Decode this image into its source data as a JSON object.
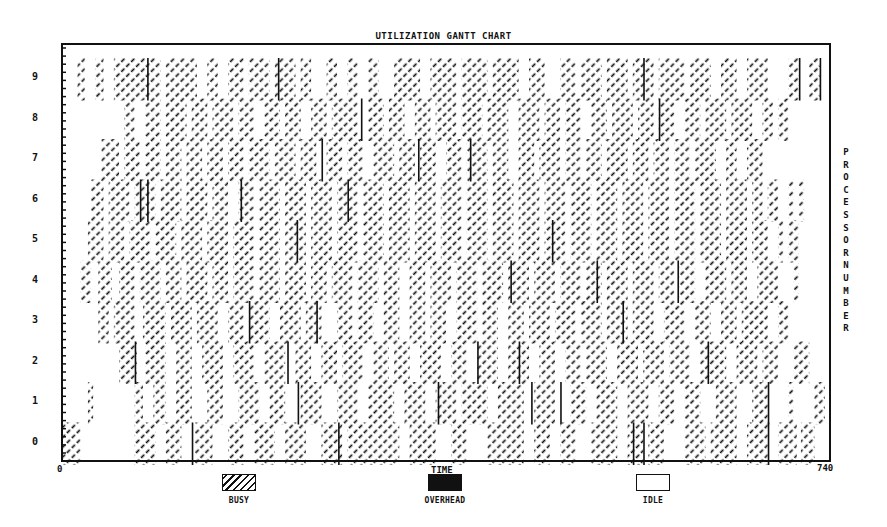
{
  "chart_data": {
    "type": "gantt",
    "title": "UTILIZATION GANTT CHART",
    "xlabel": "TIME",
    "ylabel": "PROCESSOR NUMBER",
    "xlim": [
      0,
      740
    ],
    "ylim": [
      0,
      9
    ],
    "x_tick_labels": [
      "0",
      "740"
    ],
    "y_tick_labels": [
      "0",
      "1",
      "2",
      "3",
      "4",
      "5",
      "6",
      "7",
      "8",
      "9"
    ],
    "grid": false,
    "legend": [
      {
        "key": "busy",
        "label": "BUSY",
        "style": "diagonal-hatch"
      },
      {
        "key": "overhead",
        "label": "OVERHEAD",
        "style": "solid-black"
      },
      {
        "key": "idle",
        "label": "IDLE",
        "style": "white"
      }
    ],
    "legend_position": "bottom",
    "processors": [
      {
        "id": 0,
        "busy": [
          [
            0,
            18
          ],
          [
            70,
            90
          ],
          [
            100,
            115
          ],
          [
            128,
            145
          ],
          [
            160,
            175
          ],
          [
            185,
            205
          ],
          [
            215,
            235
          ],
          [
            250,
            270
          ],
          [
            275,
            325
          ],
          [
            335,
            360
          ],
          [
            375,
            390
          ],
          [
            410,
            445
          ],
          [
            455,
            470
          ],
          [
            480,
            495
          ],
          [
            510,
            535
          ],
          [
            545,
            560
          ],
          [
            565,
            580
          ],
          [
            600,
            620
          ],
          [
            625,
            650
          ],
          [
            660,
            680
          ],
          [
            690,
            700
          ],
          [
            700,
            708
          ],
          [
            712,
            725
          ]
        ],
        "overhead": [
          [
            125,
            126
          ],
          [
            266,
            267
          ],
          [
            550,
            551
          ],
          [
            560,
            561
          ],
          [
            680,
            681
          ]
        ]
      },
      {
        "id": 1,
        "busy": [
          [
            25,
            30
          ],
          [
            70,
            78
          ],
          [
            88,
            100
          ],
          [
            110,
            125
          ],
          [
            140,
            155
          ],
          [
            170,
            190
          ],
          [
            200,
            215
          ],
          [
            230,
            250
          ],
          [
            265,
            285
          ],
          [
            295,
            320
          ],
          [
            330,
            350
          ],
          [
            360,
            380
          ],
          [
            385,
            410
          ],
          [
            420,
            445
          ],
          [
            455,
            475
          ],
          [
            490,
            505
          ],
          [
            515,
            535
          ],
          [
            545,
            565
          ],
          [
            575,
            590
          ],
          [
            600,
            615
          ],
          [
            630,
            650
          ],
          [
            665,
            680
          ],
          [
            700,
            705
          ],
          [
            725,
            735
          ]
        ],
        "overhead": [
          [
            227,
            228
          ],
          [
            362,
            363
          ],
          [
            452,
            453
          ],
          [
            480,
            481
          ],
          [
            680,
            681
          ]
        ]
      },
      {
        "id": 2,
        "busy": [
          [
            55,
            72
          ],
          [
            80,
            100
          ],
          [
            110,
            125
          ],
          [
            135,
            155
          ],
          [
            165,
            185
          ],
          [
            195,
            215
          ],
          [
            225,
            240
          ],
          [
            250,
            265
          ],
          [
            270,
            290
          ],
          [
            300,
            315
          ],
          [
            320,
            335
          ],
          [
            345,
            365
          ],
          [
            375,
            390
          ],
          [
            400,
            420
          ],
          [
            430,
            450
          ],
          [
            460,
            475
          ],
          [
            485,
            500
          ],
          [
            505,
            525
          ],
          [
            535,
            555
          ],
          [
            560,
            580
          ],
          [
            585,
            605
          ],
          [
            615,
            640
          ],
          [
            650,
            670
          ],
          [
            675,
            690
          ],
          [
            705,
            720
          ]
        ],
        "overhead": [
          [
            70,
            71
          ],
          [
            217,
            218
          ],
          [
            400,
            401
          ],
          [
            440,
            441
          ],
          [
            622,
            623
          ]
        ]
      },
      {
        "id": 3,
        "busy": [
          [
            35,
            45
          ],
          [
            50,
            70
          ],
          [
            78,
            100
          ],
          [
            105,
            125
          ],
          [
            130,
            150
          ],
          [
            160,
            175
          ],
          [
            180,
            200
          ],
          [
            210,
            230
          ],
          [
            235,
            250
          ],
          [
            265,
            280
          ],
          [
            285,
            300
          ],
          [
            310,
            325
          ],
          [
            335,
            350
          ],
          [
            355,
            370
          ],
          [
            380,
            400
          ],
          [
            405,
            420
          ],
          [
            430,
            445
          ],
          [
            450,
            470
          ],
          [
            475,
            495
          ],
          [
            500,
            520
          ],
          [
            525,
            545
          ],
          [
            550,
            570
          ],
          [
            580,
            600
          ],
          [
            610,
            625
          ],
          [
            635,
            650
          ],
          [
            655,
            680
          ],
          [
            690,
            700
          ]
        ],
        "overhead": [
          [
            180,
            181
          ],
          [
            245,
            246
          ],
          [
            540,
            541
          ]
        ]
      },
      {
        "id": 4,
        "busy": [
          [
            18,
            28
          ],
          [
            35,
            48
          ],
          [
            55,
            70
          ],
          [
            75,
            95
          ],
          [
            100,
            115
          ],
          [
            120,
            140
          ],
          [
            145,
            160
          ],
          [
            165,
            185
          ],
          [
            190,
            210
          ],
          [
            215,
            235
          ],
          [
            240,
            255
          ],
          [
            260,
            280
          ],
          [
            285,
            305
          ],
          [
            310,
            325
          ],
          [
            335,
            350
          ],
          [
            355,
            375
          ],
          [
            380,
            400
          ],
          [
            405,
            425
          ],
          [
            430,
            450
          ],
          [
            455,
            475
          ],
          [
            480,
            500
          ],
          [
            505,
            520
          ],
          [
            525,
            545
          ],
          [
            550,
            570
          ],
          [
            575,
            590
          ],
          [
            595,
            610
          ],
          [
            620,
            640
          ],
          [
            645,
            660
          ],
          [
            670,
            690
          ],
          [
            705,
            710
          ]
        ],
        "overhead": [
          [
            432,
            433
          ],
          [
            515,
            516
          ],
          [
            593,
            594
          ]
        ]
      },
      {
        "id": 5,
        "busy": [
          [
            25,
            40
          ],
          [
            45,
            60
          ],
          [
            65,
            85
          ],
          [
            90,
            110
          ],
          [
            115,
            135
          ],
          [
            140,
            160
          ],
          [
            165,
            185
          ],
          [
            190,
            210
          ],
          [
            215,
            235
          ],
          [
            240,
            260
          ],
          [
            265,
            285
          ],
          [
            290,
            310
          ],
          [
            315,
            335
          ],
          [
            340,
            360
          ],
          [
            365,
            385
          ],
          [
            390,
            410
          ],
          [
            415,
            435
          ],
          [
            440,
            460
          ],
          [
            465,
            485
          ],
          [
            490,
            510
          ],
          [
            515,
            535
          ],
          [
            540,
            560
          ],
          [
            565,
            585
          ],
          [
            590,
            610
          ],
          [
            615,
            635
          ],
          [
            640,
            660
          ],
          [
            665,
            680
          ],
          [
            690,
            695
          ],
          [
            700,
            710
          ]
        ],
        "overhead": [
          [
            226,
            227
          ],
          [
            472,
            473
          ]
        ]
      },
      {
        "id": 6,
        "busy": [
          [
            28,
            40
          ],
          [
            45,
            65
          ],
          [
            70,
            90
          ],
          [
            95,
            115
          ],
          [
            120,
            140
          ],
          [
            145,
            160
          ],
          [
            170,
            185
          ],
          [
            190,
            210
          ],
          [
            215,
            235
          ],
          [
            240,
            260
          ],
          [
            265,
            285
          ],
          [
            290,
            310
          ],
          [
            315,
            335
          ],
          [
            340,
            360
          ],
          [
            365,
            385
          ],
          [
            390,
            410
          ],
          [
            415,
            435
          ],
          [
            440,
            460
          ],
          [
            465,
            485
          ],
          [
            490,
            510
          ],
          [
            515,
            535
          ],
          [
            540,
            560
          ],
          [
            565,
            585
          ],
          [
            590,
            610
          ],
          [
            615,
            635
          ],
          [
            640,
            660
          ],
          [
            665,
            675
          ],
          [
            680,
            690
          ],
          [
            700,
            705
          ],
          [
            710,
            715
          ]
        ],
        "overhead": [
          [
            75,
            76
          ],
          [
            82,
            83
          ],
          [
            172,
            173
          ],
          [
            275,
            276
          ]
        ]
      },
      {
        "id": 7,
        "busy": [
          [
            38,
            55
          ],
          [
            60,
            75
          ],
          [
            80,
            95
          ],
          [
            100,
            115
          ],
          [
            120,
            135
          ],
          [
            140,
            155
          ],
          [
            160,
            175
          ],
          [
            180,
            200
          ],
          [
            205,
            225
          ],
          [
            230,
            245
          ],
          [
            255,
            270
          ],
          [
            275,
            290
          ],
          [
            300,
            320
          ],
          [
            325,
            340
          ],
          [
            345,
            360
          ],
          [
            370,
            385
          ],
          [
            390,
            410
          ],
          [
            415,
            430
          ],
          [
            440,
            455
          ],
          [
            460,
            480
          ],
          [
            485,
            500
          ],
          [
            505,
            520
          ],
          [
            525,
            545
          ],
          [
            550,
            565
          ],
          [
            570,
            585
          ],
          [
            590,
            605
          ],
          [
            610,
            630
          ],
          [
            640,
            650
          ],
          [
            660,
            675
          ]
        ],
        "overhead": [
          [
            250,
            251
          ],
          [
            343,
            344
          ],
          [
            393,
            394
          ]
        ]
      },
      {
        "id": 8,
        "busy": [
          [
            60,
            70
          ],
          [
            80,
            95
          ],
          [
            100,
            120
          ],
          [
            125,
            140
          ],
          [
            145,
            165
          ],
          [
            170,
            185
          ],
          [
            195,
            210
          ],
          [
            215,
            230
          ],
          [
            240,
            255
          ],
          [
            260,
            285
          ],
          [
            295,
            310
          ],
          [
            315,
            330
          ],
          [
            340,
            355
          ],
          [
            360,
            380
          ],
          [
            385,
            405
          ],
          [
            410,
            430
          ],
          [
            440,
            460
          ],
          [
            465,
            480
          ],
          [
            485,
            500
          ],
          [
            510,
            525
          ],
          [
            530,
            550
          ],
          [
            555,
            570
          ],
          [
            575,
            590
          ],
          [
            600,
            615
          ],
          [
            620,
            640
          ],
          [
            645,
            665
          ],
          [
            675,
            685
          ],
          [
            690,
            700
          ]
        ],
        "overhead": [
          [
            288,
            289
          ],
          [
            575,
            576
          ]
        ]
      },
      {
        "id": 9,
        "busy": [
          [
            15,
            22
          ],
          [
            32,
            40
          ],
          [
            50,
            95
          ],
          [
            100,
            130
          ],
          [
            140,
            150
          ],
          [
            160,
            175
          ],
          [
            180,
            200
          ],
          [
            205,
            225
          ],
          [
            230,
            240
          ],
          [
            255,
            265
          ],
          [
            275,
            285
          ],
          [
            295,
            305
          ],
          [
            320,
            345
          ],
          [
            355,
            380
          ],
          [
            385,
            410
          ],
          [
            415,
            440
          ],
          [
            450,
            465
          ],
          [
            480,
            495
          ],
          [
            500,
            520
          ],
          [
            525,
            545
          ],
          [
            550,
            570
          ],
          [
            575,
            600
          ],
          [
            605,
            625
          ],
          [
            635,
            650
          ],
          [
            660,
            680
          ],
          [
            700,
            710
          ],
          [
            720,
            730
          ]
        ],
        "overhead": [
          [
            82,
            83
          ],
          [
            208,
            209
          ],
          [
            560,
            561
          ],
          [
            710,
            711
          ],
          [
            730,
            731
          ]
        ]
      }
    ]
  },
  "labels": {
    "title": "UTILIZATION GANTT CHART",
    "x_start": "0",
    "x_end": "740",
    "x_axis": "TIME",
    "y_axis": "PROCESSOR NUMBER",
    "legend_busy": "BUSY",
    "legend_overhead": "OVERHEAD",
    "legend_idle": "IDLE"
  }
}
